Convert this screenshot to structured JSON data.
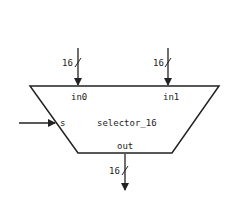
{
  "block": {
    "name": "selector_16",
    "shape": "trapezoid",
    "stroke_color": "#222222"
  },
  "ports": {
    "in0": {
      "label": "in0",
      "width": "16",
      "direction": "input"
    },
    "in1": {
      "label": "in1",
      "width": "16",
      "direction": "input"
    },
    "s": {
      "label": "s",
      "direction": "input"
    },
    "out": {
      "label": "out",
      "width": "16",
      "direction": "output"
    }
  }
}
